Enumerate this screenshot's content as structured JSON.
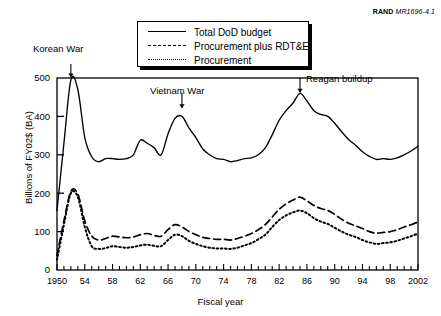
{
  "figure": {
    "source_tag_bold": "RAND",
    "source_tag_italic": "MR1696-4.1"
  },
  "legend": {
    "items": [
      {
        "label": "Total DoD budget",
        "style": "solid",
        "key": "total"
      },
      {
        "label": "Procurement plus RDT&E",
        "style": "dashed",
        "key": "proc_rdte"
      },
      {
        "label": "Procurement",
        "style": "dotted",
        "key": "proc"
      }
    ]
  },
  "annotations": [
    {
      "text": "Korean War",
      "year": 1952,
      "value": 500
    },
    {
      "text": "Vietnam War",
      "year": 1968,
      "value": 420
    },
    {
      "text": "Reagan buildup",
      "year": 1985,
      "value": 460
    }
  ],
  "axes": {
    "y_ticks": [
      "0",
      "100",
      "200",
      "300",
      "400",
      "500"
    ],
    "x_ticks": [
      "1950",
      "54",
      "58",
      "62",
      "66",
      "70",
      "74",
      "78",
      "82",
      "86",
      "90",
      "94",
      "98",
      "2002"
    ],
    "xlabel": "Fiscal year",
    "ylabel": "Billions of FY02$ (BA)"
  },
  "chart_data": {
    "type": "line",
    "title": "",
    "xlabel": "Fiscal year",
    "ylabel": "Billions of FY02$ (BA)",
    "xlim": [
      1950,
      2002
    ],
    "ylim": [
      0,
      500
    ],
    "grid": false,
    "legend_position": "top-center",
    "x": [
      1950,
      1951,
      1952,
      1953,
      1954,
      1955,
      1956,
      1957,
      1958,
      1959,
      1960,
      1961,
      1962,
      1963,
      1964,
      1965,
      1966,
      1967,
      1968,
      1969,
      1970,
      1971,
      1972,
      1973,
      1974,
      1975,
      1976,
      1977,
      1978,
      1979,
      1980,
      1981,
      1982,
      1983,
      1984,
      1985,
      1986,
      1987,
      1988,
      1989,
      1990,
      1991,
      1992,
      1993,
      1994,
      1995,
      1996,
      1997,
      1998,
      1999,
      2000,
      2001,
      2002
    ],
    "series": [
      {
        "name": "Total DoD budget",
        "style": "solid",
        "values": [
          155,
          330,
          495,
          470,
          345,
          295,
          282,
          290,
          290,
          288,
          290,
          300,
          338,
          330,
          318,
          300,
          355,
          395,
          400,
          370,
          345,
          315,
          300,
          290,
          288,
          282,
          285,
          290,
          292,
          300,
          318,
          352,
          390,
          415,
          435,
          460,
          440,
          415,
          405,
          400,
          382,
          360,
          340,
          325,
          308,
          296,
          288,
          290,
          288,
          292,
          300,
          310,
          322
        ]
      },
      {
        "name": "Procurement plus RDT&E",
        "style": "dashed",
        "values": [
          38,
          128,
          205,
          198,
          128,
          88,
          78,
          82,
          88,
          86,
          84,
          86,
          92,
          95,
          90,
          88,
          105,
          118,
          112,
          100,
          92,
          85,
          82,
          80,
          80,
          78,
          82,
          88,
          95,
          105,
          118,
          138,
          158,
          172,
          182,
          190,
          180,
          168,
          160,
          155,
          145,
          132,
          122,
          115,
          108,
          100,
          96,
          98,
          100,
          105,
          112,
          118,
          125
        ]
      },
      {
        "name": "Procurement",
        "style": "dotted",
        "values": [
          26,
          118,
          200,
          190,
          112,
          62,
          55,
          57,
          62,
          60,
          58,
          60,
          64,
          66,
          63,
          62,
          78,
          92,
          88,
          76,
          68,
          62,
          58,
          56,
          56,
          55,
          58,
          64,
          70,
          80,
          92,
          112,
          130,
          142,
          150,
          155,
          148,
          135,
          126,
          120,
          110,
          100,
          92,
          86,
          78,
          72,
          68,
          70,
          72,
          76,
          82,
          88,
          95
        ]
      }
    ]
  }
}
